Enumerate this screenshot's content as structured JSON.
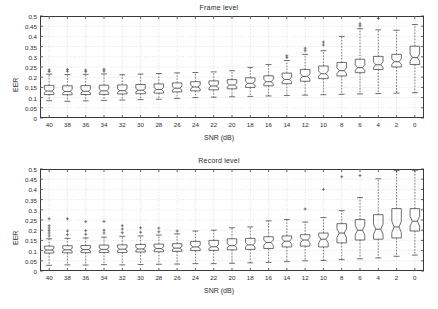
{
  "figure": {
    "background": "#ffffff",
    "axis_color": "#3a3a3a",
    "grid_color": "#cfcfcf",
    "box_color": "#4a4a4a",
    "median_color": "#4a4a4a",
    "whisker_color": "#4a4a4a",
    "outlier_color": "#4a4a4a"
  },
  "chart_data": [
    {
      "type": "box",
      "title": "Frame level",
      "xlabel": "SNR (dB)",
      "ylabel": "EER",
      "categories": [
        "40",
        "38",
        "36",
        "34",
        "32",
        "30",
        "28",
        "26",
        "24",
        "22",
        "20",
        "18",
        "16",
        "14",
        "12",
        "10",
        "8",
        "6",
        "4",
        "2",
        "0"
      ],
      "ylim": [
        0,
        0.5
      ],
      "yticks": [
        0,
        0.05,
        0.1,
        0.15,
        0.2,
        0.25,
        0.3,
        0.35,
        0.4,
        0.45,
        0.5
      ],
      "ytick_labels": [
        "0",
        "0.05",
        "0.1",
        "0.15",
        "0.2",
        "0.25",
        "0.3",
        "0.35",
        "0.4",
        "0.45",
        "0.5"
      ],
      "grid": true,
      "notched": true,
      "boxes": [
        {
          "category": "40",
          "whisker_low": 0.085,
          "q1": 0.115,
          "median": 0.132,
          "q3": 0.16,
          "whisker_high": 0.215,
          "notch_low": 0.124,
          "notch_high": 0.141,
          "outliers": [
            0.228,
            0.236
          ]
        },
        {
          "category": "38",
          "whisker_low": 0.082,
          "q1": 0.114,
          "median": 0.13,
          "q3": 0.158,
          "whisker_high": 0.213,
          "notch_low": 0.122,
          "notch_high": 0.139,
          "outliers": [
            0.229,
            0.238
          ]
        },
        {
          "category": "36",
          "whisker_low": 0.084,
          "q1": 0.115,
          "median": 0.131,
          "q3": 0.159,
          "whisker_high": 0.214,
          "notch_low": 0.123,
          "notch_high": 0.14,
          "outliers": [
            0.227,
            0.235
          ]
        },
        {
          "category": "34",
          "whisker_low": 0.086,
          "q1": 0.116,
          "median": 0.133,
          "q3": 0.161,
          "whisker_high": 0.216,
          "notch_low": 0.125,
          "notch_high": 0.142,
          "outliers": [
            0.23,
            0.239
          ]
        },
        {
          "category": "32",
          "whisker_low": 0.088,
          "q1": 0.118,
          "median": 0.134,
          "q3": 0.162,
          "whisker_high": 0.212,
          "notch_low": 0.126,
          "notch_high": 0.143,
          "outliers": []
        },
        {
          "category": "30",
          "whisker_low": 0.09,
          "q1": 0.119,
          "median": 0.136,
          "q3": 0.164,
          "whisker_high": 0.215,
          "notch_low": 0.128,
          "notch_high": 0.145,
          "outliers": []
        },
        {
          "category": "28",
          "whisker_low": 0.092,
          "q1": 0.122,
          "median": 0.14,
          "q3": 0.167,
          "whisker_high": 0.218,
          "notch_low": 0.131,
          "notch_high": 0.149,
          "outliers": []
        },
        {
          "category": "26",
          "whisker_low": 0.096,
          "q1": 0.128,
          "median": 0.146,
          "q3": 0.172,
          "whisker_high": 0.221,
          "notch_low": 0.137,
          "notch_high": 0.155,
          "outliers": []
        },
        {
          "category": "24",
          "whisker_low": 0.1,
          "q1": 0.133,
          "median": 0.152,
          "q3": 0.178,
          "whisker_high": 0.223,
          "notch_low": 0.143,
          "notch_high": 0.161,
          "outliers": []
        },
        {
          "category": "22",
          "whisker_low": 0.102,
          "q1": 0.138,
          "median": 0.157,
          "q3": 0.182,
          "whisker_high": 0.226,
          "notch_low": 0.148,
          "notch_high": 0.166,
          "outliers": []
        },
        {
          "category": "20",
          "whisker_low": 0.104,
          "q1": 0.143,
          "median": 0.162,
          "q3": 0.188,
          "whisker_high": 0.232,
          "notch_low": 0.153,
          "notch_high": 0.171,
          "outliers": []
        },
        {
          "category": "18",
          "whisker_low": 0.106,
          "q1": 0.15,
          "median": 0.17,
          "q3": 0.197,
          "whisker_high": 0.248,
          "notch_low": 0.16,
          "notch_high": 0.18,
          "outliers": []
        },
        {
          "category": "16",
          "whisker_low": 0.108,
          "q1": 0.158,
          "median": 0.178,
          "q3": 0.207,
          "whisker_high": 0.262,
          "notch_low": 0.168,
          "notch_high": 0.189,
          "outliers": []
        },
        {
          "category": "14",
          "whisker_low": 0.11,
          "q1": 0.168,
          "median": 0.189,
          "q3": 0.22,
          "whisker_high": 0.282,
          "notch_low": 0.178,
          "notch_high": 0.2,
          "outliers": [
            0.296,
            0.305
          ]
        },
        {
          "category": "12",
          "whisker_low": 0.112,
          "q1": 0.18,
          "median": 0.204,
          "q3": 0.238,
          "whisker_high": 0.312,
          "notch_low": 0.191,
          "notch_high": 0.217,
          "outliers": [
            0.33,
            0.342
          ]
        },
        {
          "category": "10",
          "whisker_low": 0.114,
          "q1": 0.193,
          "median": 0.217,
          "q3": 0.255,
          "whisker_high": 0.33,
          "notch_low": 0.204,
          "notch_high": 0.231,
          "outliers": [
            0.358,
            0.372
          ]
        },
        {
          "category": "8",
          "whisker_low": 0.116,
          "q1": 0.206,
          "median": 0.232,
          "q3": 0.272,
          "whisker_high": 0.4,
          "notch_low": 0.218,
          "notch_high": 0.246,
          "outliers": []
        },
        {
          "category": "6",
          "whisker_low": 0.118,
          "q1": 0.222,
          "median": 0.247,
          "q3": 0.288,
          "whisker_high": 0.438,
          "notch_low": 0.233,
          "notch_high": 0.261,
          "outliers": [
            0.452,
            0.462
          ]
        },
        {
          "category": "4",
          "whisker_low": 0.12,
          "q1": 0.238,
          "median": 0.261,
          "q3": 0.302,
          "whisker_high": 0.432,
          "notch_low": 0.248,
          "notch_high": 0.275,
          "outliers": [
            0.488
          ]
        },
        {
          "category": "2",
          "whisker_low": 0.122,
          "q1": 0.25,
          "median": 0.276,
          "q3": 0.312,
          "whisker_high": 0.43,
          "notch_low": 0.262,
          "notch_high": 0.29,
          "outliers": []
        },
        {
          "category": "0",
          "whisker_low": 0.124,
          "q1": 0.262,
          "median": 0.296,
          "q3": 0.352,
          "whisker_high": 0.458,
          "notch_low": 0.278,
          "notch_high": 0.314,
          "outliers": []
        }
      ]
    },
    {
      "type": "box",
      "title": "Record level",
      "xlabel": "SNR (dB)",
      "ylabel": "EER",
      "categories": [
        "40",
        "38",
        "36",
        "34",
        "32",
        "30",
        "28",
        "26",
        "24",
        "22",
        "20",
        "18",
        "16",
        "14",
        "12",
        "10",
        "8",
        "6",
        "4",
        "2",
        "0"
      ],
      "ylim": [
        0,
        0.5
      ],
      "yticks": [
        0,
        0.05,
        0.1,
        0.15,
        0.2,
        0.25,
        0.3,
        0.35,
        0.4,
        0.45,
        0.5
      ],
      "ytick_labels": [
        "0",
        "0.05",
        "0.1",
        "0.15",
        "0.2",
        "0.25",
        "0.3",
        "0.35",
        "0.4",
        "0.45",
        "0.5"
      ],
      "grid": true,
      "notched": true,
      "boxes": [
        {
          "category": "40",
          "whisker_low": 0.028,
          "q1": 0.088,
          "median": 0.103,
          "q3": 0.122,
          "whisker_high": 0.158,
          "notch_low": 0.096,
          "notch_high": 0.11,
          "outliers": [
            0.172,
            0.186,
            0.198,
            0.21,
            0.222,
            0.256
          ]
        },
        {
          "category": "38",
          "whisker_low": 0.03,
          "q1": 0.089,
          "median": 0.104,
          "q3": 0.124,
          "whisker_high": 0.16,
          "notch_low": 0.097,
          "notch_high": 0.111,
          "outliers": [
            0.178,
            0.196,
            0.256
          ]
        },
        {
          "category": "36",
          "whisker_low": 0.029,
          "q1": 0.09,
          "median": 0.105,
          "q3": 0.125,
          "whisker_high": 0.162,
          "notch_low": 0.098,
          "notch_high": 0.112,
          "outliers": [
            0.18,
            0.198,
            0.242
          ]
        },
        {
          "category": "34",
          "whisker_low": 0.031,
          "q1": 0.091,
          "median": 0.106,
          "q3": 0.127,
          "whisker_high": 0.166,
          "notch_low": 0.099,
          "notch_high": 0.113,
          "outliers": [
            0.186,
            0.2,
            0.243
          ]
        },
        {
          "category": "32",
          "whisker_low": 0.03,
          "q1": 0.091,
          "median": 0.107,
          "q3": 0.128,
          "whisker_high": 0.17,
          "notch_low": 0.1,
          "notch_high": 0.114,
          "outliers": [
            0.188,
            0.206,
            0.222
          ]
        },
        {
          "category": "30",
          "whisker_low": 0.032,
          "q1": 0.093,
          "median": 0.108,
          "q3": 0.13,
          "whisker_high": 0.172,
          "notch_low": 0.101,
          "notch_high": 0.116,
          "outliers": [
            0.19,
            0.212
          ]
        },
        {
          "category": "28",
          "whisker_low": 0.033,
          "q1": 0.094,
          "median": 0.11,
          "q3": 0.132,
          "whisker_high": 0.176,
          "notch_low": 0.103,
          "notch_high": 0.118,
          "outliers": [
            0.192,
            0.21
          ]
        },
        {
          "category": "26",
          "whisker_low": 0.034,
          "q1": 0.096,
          "median": 0.112,
          "q3": 0.134,
          "whisker_high": 0.182,
          "notch_low": 0.105,
          "notch_high": 0.12,
          "outliers": [
            0.196
          ]
        },
        {
          "category": "24",
          "whisker_low": 0.036,
          "q1": 0.1,
          "median": 0.118,
          "q3": 0.145,
          "whisker_high": 0.196,
          "notch_low": 0.11,
          "notch_high": 0.127,
          "outliers": []
        },
        {
          "category": "22",
          "whisker_low": 0.036,
          "q1": 0.101,
          "median": 0.119,
          "q3": 0.15,
          "whisker_high": 0.2,
          "notch_low": 0.111,
          "notch_high": 0.129,
          "outliers": []
        },
        {
          "category": "20",
          "whisker_low": 0.038,
          "q1": 0.104,
          "median": 0.124,
          "q3": 0.158,
          "whisker_high": 0.212,
          "notch_low": 0.115,
          "notch_high": 0.134,
          "outliers": []
        },
        {
          "category": "18",
          "whisker_low": 0.04,
          "q1": 0.106,
          "median": 0.128,
          "q3": 0.16,
          "whisker_high": 0.216,
          "notch_low": 0.118,
          "notch_high": 0.139,
          "outliers": []
        },
        {
          "category": "16",
          "whisker_low": 0.042,
          "q1": 0.11,
          "median": 0.14,
          "q3": 0.168,
          "whisker_high": 0.246,
          "notch_low": 0.126,
          "notch_high": 0.152,
          "outliers": []
        },
        {
          "category": "14",
          "whisker_low": 0.046,
          "q1": 0.118,
          "median": 0.146,
          "q3": 0.172,
          "whisker_high": 0.252,
          "notch_low": 0.132,
          "notch_high": 0.158,
          "outliers": []
        },
        {
          "category": "12",
          "whisker_low": 0.05,
          "q1": 0.122,
          "median": 0.152,
          "q3": 0.178,
          "whisker_high": 0.24,
          "notch_low": 0.138,
          "notch_high": 0.164,
          "outliers": [
            0.304
          ]
        },
        {
          "category": "10",
          "whisker_low": 0.052,
          "q1": 0.118,
          "median": 0.156,
          "q3": 0.186,
          "whisker_high": 0.262,
          "notch_low": 0.138,
          "notch_high": 0.172,
          "outliers": [
            0.4
          ]
        },
        {
          "category": "8",
          "whisker_low": 0.056,
          "q1": 0.138,
          "median": 0.186,
          "q3": 0.232,
          "whisker_high": 0.296,
          "notch_low": 0.164,
          "notch_high": 0.206,
          "outliers": [
            0.462
          ]
        },
        {
          "category": "6",
          "whisker_low": 0.06,
          "q1": 0.152,
          "median": 0.2,
          "q3": 0.252,
          "whisker_high": 0.36,
          "notch_low": 0.176,
          "notch_high": 0.224,
          "outliers": [
            0.468
          ]
        },
        {
          "category": "4",
          "whisker_low": 0.064,
          "q1": 0.156,
          "median": 0.205,
          "q3": 0.276,
          "whisker_high": 0.452,
          "notch_low": 0.18,
          "notch_high": 0.23,
          "outliers": []
        },
        {
          "category": "2",
          "whisker_low": 0.072,
          "q1": 0.162,
          "median": 0.216,
          "q3": 0.306,
          "whisker_high": 0.492,
          "notch_low": 0.188,
          "notch_high": 0.244,
          "outliers": []
        },
        {
          "category": "0",
          "whisker_low": 0.078,
          "q1": 0.196,
          "median": 0.244,
          "q3": 0.306,
          "whisker_high": 0.494,
          "notch_low": 0.22,
          "notch_high": 0.268,
          "outliers": []
        }
      ]
    }
  ]
}
